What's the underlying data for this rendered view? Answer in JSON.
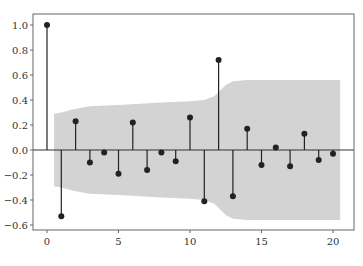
{
  "chart_data": {
    "type": "stem",
    "title": "",
    "xlabel": "",
    "ylabel": "",
    "xlim": [
      -1,
      21
    ],
    "ylim": [
      -0.65,
      1.08
    ],
    "x_ticks": [
      0,
      5,
      10,
      15,
      20
    ],
    "x_tick_labels": [
      "0",
      "5",
      "10",
      "15",
      "20"
    ],
    "y_ticks": [
      1.0,
      0.8,
      0.6,
      0.4,
      0.2,
      0.0,
      -0.2,
      -0.4,
      -0.6
    ],
    "y_tick_labels": [
      "1.0",
      "0.8",
      "0.6",
      "0.4",
      "0.2",
      "0.0",
      "−0.2",
      "−0.4",
      "−0.6"
    ],
    "grid": false,
    "legend": null,
    "series": [
      {
        "name": "autocorrelation",
        "x": [
          0,
          1,
          2,
          3,
          4,
          5,
          6,
          7,
          8,
          9,
          10,
          11,
          12,
          13,
          14,
          15,
          16,
          17,
          18,
          19,
          20
        ],
        "values": [
          1.0,
          -0.53,
          0.23,
          -0.1,
          -0.02,
          -0.19,
          0.22,
          -0.16,
          -0.02,
          -0.09,
          0.26,
          -0.41,
          0.72,
          -0.37,
          0.17,
          -0.12,
          0.02,
          -0.13,
          0.13,
          -0.08,
          -0.03
        ]
      }
    ],
    "confidence_band": {
      "x": [
        0.5,
        1,
        2,
        3,
        5,
        8,
        10,
        11,
        11.7,
        12.5,
        13,
        14,
        20.5
      ],
      "upper": [
        0.29,
        0.3,
        0.33,
        0.35,
        0.36,
        0.38,
        0.39,
        0.4,
        0.43,
        0.52,
        0.55,
        0.56,
        0.56
      ]
    },
    "colors": {
      "stem": "#222222",
      "band": "#d3d3d3",
      "axis": "#555555"
    }
  }
}
